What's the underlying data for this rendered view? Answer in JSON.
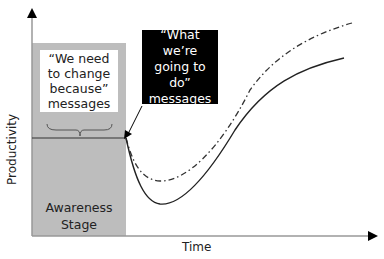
{
  "diagram": {
    "title": "",
    "axes": {
      "y_label": "Productivity",
      "x_label": "Time"
    },
    "stage_box": {
      "label_line1": "Awareness",
      "label_line2": "Stage",
      "color": "#bdbdbd"
    },
    "callout_white": {
      "line1": "“We need",
      "line2": "to change",
      "line3": "because”",
      "line4": "messages"
    },
    "callout_black": {
      "line1": "“What we’re",
      "line2": "going to do”",
      "line3": "messages",
      "color": "#000000"
    },
    "curves": [
      {
        "name": "solid-curve",
        "style": "solid",
        "description": "productivity dips deeply after change then recovers"
      },
      {
        "name": "dash-dot-curve",
        "style": "dash-dot",
        "description": "productivity dips less then recovers higher"
      }
    ],
    "baseline": {
      "style": "solid horizontal line at pre-change productivity level"
    }
  }
}
